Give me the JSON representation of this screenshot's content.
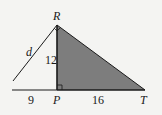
{
  "diagram": {
    "points": {
      "R": {
        "label": "R",
        "x": 57,
        "y": 25
      },
      "P": {
        "label": "P",
        "x": 57,
        "y": 90
      },
      "T": {
        "label": "T",
        "x": 145,
        "y": 90
      }
    },
    "labels": {
      "d": "d",
      "rp_length": "12",
      "left_base_length": "9",
      "pt_length": "16"
    },
    "colors": {
      "shaded_fill": "#7d7d7d",
      "line": "#1a1a1a",
      "background": "#f4f4f2"
    },
    "right_angles": [
      "P",
      "R"
    ]
  }
}
